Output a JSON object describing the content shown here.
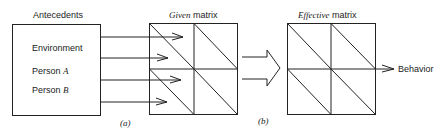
{
  "antecedents": {
    "title": "Antecedents",
    "items": [
      {
        "label": "Environment",
        "suffix": ""
      },
      {
        "label": "Person ",
        "suffix": "A"
      },
      {
        "label": "Person ",
        "suffix": "B"
      }
    ]
  },
  "given_matrix": {
    "title_italic": "Given",
    "title_rest": " matrix"
  },
  "effective_matrix": {
    "title_italic": "Effective",
    "title_rest": " matrix"
  },
  "output": {
    "label": "Behavior"
  },
  "panels": {
    "a": "(a)",
    "b": "(b)"
  },
  "colors": {
    "stroke": "#222222",
    "background": "#ffffff"
  }
}
